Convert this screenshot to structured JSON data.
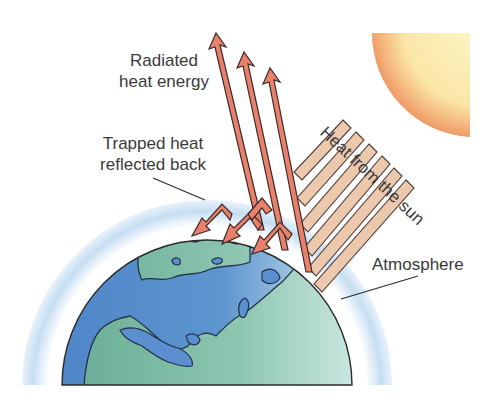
{
  "diagram": {
    "labels": {
      "radiated": [
        "Radiated",
        "heat energy"
      ],
      "trapped": [
        "Trapped heat",
        "reflected back"
      ],
      "atmosphere": "Atmosphere",
      "sun_heat": "Heat from the sun"
    },
    "elements": {
      "sun": "sun",
      "earth": "earth-globe",
      "atmosphere": "atmosphere-layer",
      "incoming_rays_count": 6,
      "radiated_arrows_count": 3,
      "reflected_arrows_count": 3
    },
    "colors": {
      "ocean": "#5b8fcf",
      "land": "#7fbfa4",
      "atmosphere": "#cfe3f3",
      "sun_inner": "#fdf0b0",
      "sun_edge": "#f2a66a",
      "arrow_fill": "#e8806a",
      "arrow_outline": "#3a2a2a",
      "ray_fill": "#ecc9ad",
      "text": "#3a3a3a"
    }
  }
}
